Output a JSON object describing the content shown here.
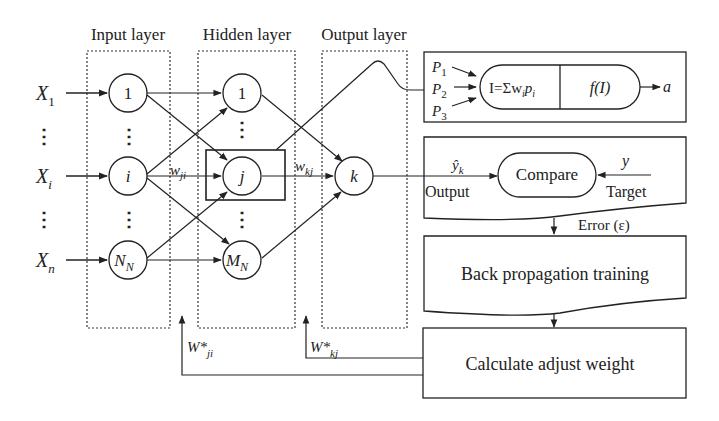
{
  "diagram": {
    "type": "neural-network-backpropagation",
    "layers": {
      "input": {
        "label": "Input layer",
        "nodes": [
          "1",
          "i",
          "N_N"
        ]
      },
      "hidden": {
        "label": "Hidden layer",
        "nodes": [
          "1",
          "j",
          "M_N"
        ]
      },
      "output": {
        "label": "Output layer",
        "nodes": [
          "k"
        ]
      }
    },
    "inputs": [
      {
        "base": "X",
        "sub": "1"
      },
      {
        "base": "X",
        "sub": "i"
      },
      {
        "base": "X",
        "sub": "n"
      }
    ],
    "node_labels": {
      "in_1": "1",
      "in_i": "i",
      "in_N_base": "N",
      "in_N_sub": "N",
      "hid_1": "1",
      "hid_j": "j",
      "hid_M_base": "M",
      "hid_M_sub": "N",
      "out_k": "k"
    },
    "weights": {
      "w_ji_base": "w",
      "w_ji_sub": "ji",
      "w_kj_base": "w",
      "w_kj_sub": "kj",
      "W_ji_star_base": "W*",
      "W_ji_star_sub": "ji",
      "W_kj_star_base": "W*",
      "W_kj_star_sub": "kj"
    },
    "neuron_detail": {
      "inputs": [
        {
          "base": "P",
          "sub": "1"
        },
        {
          "base": "P",
          "sub": "2"
        },
        {
          "base": "P",
          "sub": "3"
        }
      ],
      "sum_prefix": "I=Σw",
      "sum_sub1": "i",
      "sum_p": "p",
      "sum_sub2": "i",
      "activation": "f(I)",
      "output": "a"
    },
    "compare": {
      "label": "Compare",
      "output_symbol": "ŷ",
      "output_sub": "k",
      "output_label": "Output",
      "target_symbol": "y",
      "target_label": "Target"
    },
    "error_label": "Error (ε)",
    "backprop_label": "Back propagation training",
    "adjust_label": "Calculate adjust weight",
    "ellipsis": "⋮"
  }
}
